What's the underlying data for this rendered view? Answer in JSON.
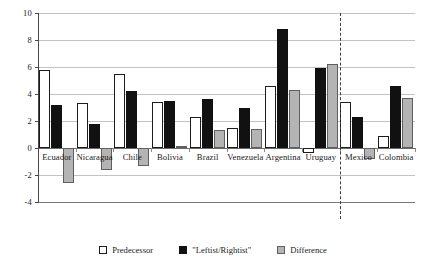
{
  "chart_data": {
    "type": "bar",
    "title": "",
    "subtitle": "",
    "xlabel": "",
    "ylabel": "",
    "ylim": [
      -4,
      10
    ],
    "yticks": [
      10,
      8,
      6,
      4,
      2,
      0,
      -2,
      -4
    ],
    "ytick_labels": [
      "10",
      "8",
      "6",
      "4",
      "2",
      "0",
      "-2",
      "-4"
    ],
    "grid": true,
    "legend_position": "bottom",
    "categories": [
      "Ecuador",
      "Nicaragua",
      "Chile",
      "Bolivia",
      "Brazil",
      "Venezuela",
      "Argentina",
      "Uruguay",
      "Mexico",
      "Colombia"
    ],
    "series": [
      {
        "name": "Predecessor",
        "key": "predecessor",
        "color": "#ffffff",
        "values": [
          5.8,
          3.35,
          5.5,
          3.4,
          2.3,
          1.5,
          4.6,
          -0.4,
          3.4,
          0.9
        ]
      },
      {
        "name": "\"Leftist/Rightist\"",
        "key": "leftist",
        "color": "#111111",
        "values": [
          3.2,
          1.8,
          4.25,
          3.5,
          3.6,
          3.0,
          8.8,
          5.9,
          2.3,
          4.6
        ]
      },
      {
        "name": "Difference",
        "key": "difference",
        "color": "#b4b4b4",
        "values": [
          -2.6,
          -1.6,
          -1.3,
          0.15,
          1.3,
          1.4,
          4.3,
          6.2,
          -0.8,
          3.7
        ]
      }
    ],
    "divider": {
      "after_category": "Uruguay",
      "style": "dashed",
      "note": "separates leftist-governed countries from rightist-governed countries"
    },
    "caption": ""
  },
  "legend": {
    "items": [
      {
        "label": "Predecessor",
        "swatch": "predecessor"
      },
      {
        "label": "\"Leftist/Rightist\"",
        "swatch": "leftist"
      },
      {
        "label": "Difference",
        "swatch": "difference"
      }
    ]
  }
}
